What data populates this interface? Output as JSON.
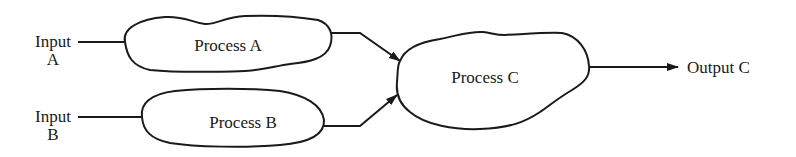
{
  "diagram": {
    "type": "process-flow",
    "inputs": [
      {
        "id": "input-a",
        "line1": "Input",
        "line2": "A"
      },
      {
        "id": "input-b",
        "line1": "Input",
        "line2": "B"
      }
    ],
    "processes": [
      {
        "id": "process-a",
        "label": "Process A"
      },
      {
        "id": "process-b",
        "label": "Process B"
      },
      {
        "id": "process-c",
        "label": "Process C"
      }
    ],
    "outputs": [
      {
        "id": "output-c",
        "label": "Output C"
      }
    ],
    "edges": [
      {
        "from": "Input A",
        "to": "Process A"
      },
      {
        "from": "Input B",
        "to": "Process B"
      },
      {
        "from": "Process A",
        "to": "Process C"
      },
      {
        "from": "Process B",
        "to": "Process C"
      },
      {
        "from": "Process C",
        "to": "Output C"
      }
    ],
    "colors": {
      "stroke": "#1a1a1a",
      "background": "#ffffff"
    }
  }
}
